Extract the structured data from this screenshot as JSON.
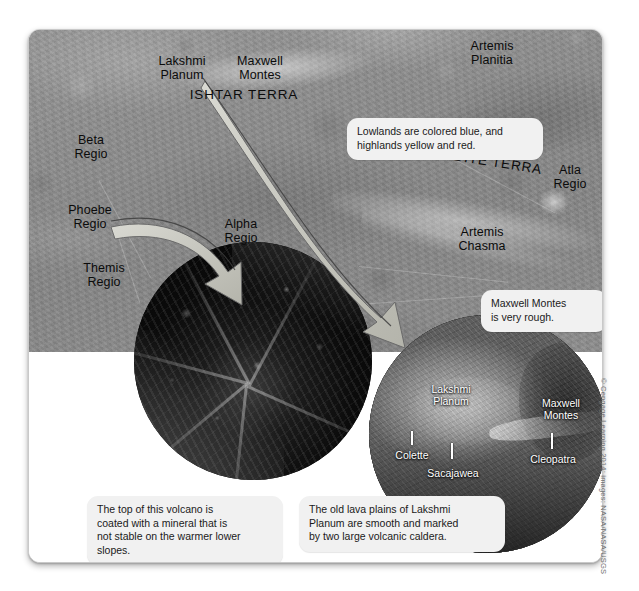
{
  "figure": {
    "credit": "© Cengage Learning 2014; images: NASA/NASA/USGS"
  },
  "global_map": {
    "labels": [
      {
        "id": "lakshmi-planum",
        "text": "Lakshmi\nPlanum",
        "style": "normal"
      },
      {
        "id": "maxwell-montes",
        "text": "Maxwell\nMontes",
        "style": "normal"
      },
      {
        "id": "ishtar-terra",
        "text": "ISHTAR TERRA",
        "style": "caps"
      },
      {
        "id": "artemis-planitia",
        "text": "Artemis\nPlanitia",
        "style": "normal"
      },
      {
        "id": "beta-regio",
        "text": "Beta\nRegio",
        "style": "normal"
      },
      {
        "id": "atla-regio",
        "text": "Atla\nRegio",
        "style": "normal"
      },
      {
        "id": "aphrodite-terra",
        "text": "APHRODITE TERRA",
        "style": "caps"
      },
      {
        "id": "phoebe-regio",
        "text": "Phoebe\nRegio",
        "style": "normal"
      },
      {
        "id": "alpha-regio",
        "text": "Alpha\nRegio",
        "style": "normal"
      },
      {
        "id": "themis-regio",
        "text": "Themis\nRegio",
        "style": "normal"
      },
      {
        "id": "artemis-chasma",
        "text": "Artemis\nChasma",
        "style": "normal"
      }
    ]
  },
  "callouts": {
    "lowlands": "Lowlands are colored blue, and\nhighlands yellow and red.",
    "maxwell_rough": "Maxwell Montes\nis very rough.",
    "volcano_caption": "The top of this volcano is\ncoated with a mineral that is\nnot stable on the warmer lower\nslopes.",
    "lava_caption": "The old lava plains of Lakshmi\nPlanum are smooth and marked\nby two large volcanic caldera."
  },
  "inset_left": {
    "name": "maat-mons-volcano-inset"
  },
  "inset_right": {
    "name": "ishtar-terra-radar-inset",
    "labels": [
      {
        "id": "lakshmi-planum",
        "text": "Lakshmi\nPlanum"
      },
      {
        "id": "maxwell-montes",
        "text": "Maxwell\nMontes"
      },
      {
        "id": "colette",
        "text": "Colette"
      },
      {
        "id": "sacajawea",
        "text": "Sacajawea"
      },
      {
        "id": "cleopatra",
        "text": "Cleopatra"
      }
    ]
  },
  "colors": {
    "map_gray": "#8e8e8e",
    "callout_bg": "#f1f1f1",
    "arrow_fill": "#c9c9c0",
    "arrow_stroke": "#4a4a4a",
    "label_text": "#0b0b0b",
    "inset_label_text": "#ffffff"
  }
}
